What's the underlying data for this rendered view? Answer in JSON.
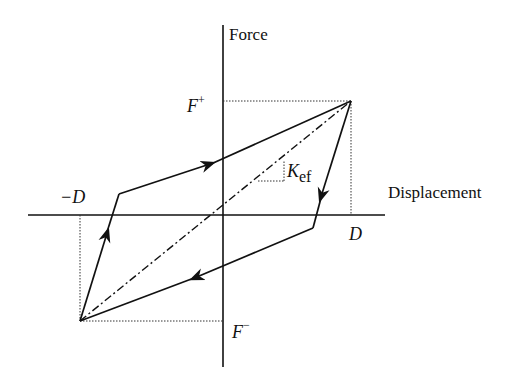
{
  "diagram": {
    "axes": {
      "y_label": "Force",
      "x_label": "Displacement"
    },
    "labels": {
      "f_plus_base": "F",
      "f_plus_sup": "+",
      "f_minus_base": "F",
      "f_minus_sup": "−",
      "d_pos": "D",
      "d_neg": "−D",
      "k_base": "K",
      "k_sub": "ef"
    },
    "colors": {
      "line": "#111111",
      "background": "#ffffff"
    }
  }
}
